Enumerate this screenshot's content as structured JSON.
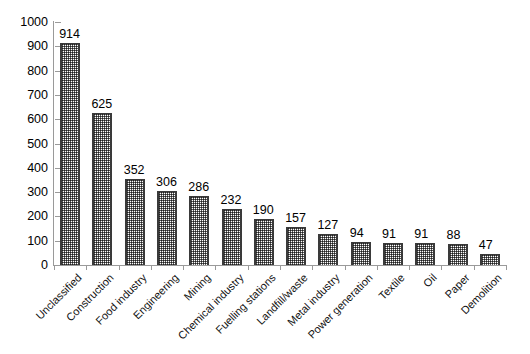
{
  "chart_data": {
    "type": "bar",
    "title": "",
    "subtitle": "",
    "xlabel": "",
    "ylabel": "",
    "ylim": [
      0,
      1000
    ],
    "ytick_step": 100,
    "yticks": [
      0,
      100,
      200,
      300,
      400,
      500,
      600,
      700,
      800,
      900,
      1000
    ],
    "grid": false,
    "legend": false,
    "legend_position": "none",
    "bar_fill": "#ffffff",
    "bar_pattern": "fine-dotted-stipple",
    "bar_edge_color": "#3a3a3a",
    "axis_color": "#9a9a9a",
    "background": "#ffffff",
    "value_labels_shown": true,
    "category_label_rotation_deg": -45,
    "categories": [
      "Unclassified",
      "Construction",
      "Food industry",
      "Engineering",
      "Mining",
      "Chemical industry",
      "Fuelling stations",
      "Landfill/waste",
      "Metal industry",
      "Power generation",
      "Textile",
      "Oil",
      "Paper",
      "Demolition"
    ],
    "values": [
      914,
      625,
      352,
      306,
      286,
      232,
      190,
      157,
      127,
      94,
      91,
      91,
      88,
      47
    ],
    "series": [
      {
        "name": "Count",
        "values": [
          914,
          625,
          352,
          306,
          286,
          232,
          190,
          157,
          127,
          94,
          91,
          91,
          88,
          47
        ]
      }
    ],
    "value_labels": [
      "914",
      "625",
      "352",
      "306",
      "286",
      "232",
      "190",
      "157",
      "127",
      "94",
      "91",
      "91",
      "88",
      "47"
    ],
    "ytick_labels": [
      "0",
      "100",
      "200",
      "300",
      "400",
      "500",
      "600",
      "700",
      "800",
      "900",
      "1000"
    ]
  }
}
